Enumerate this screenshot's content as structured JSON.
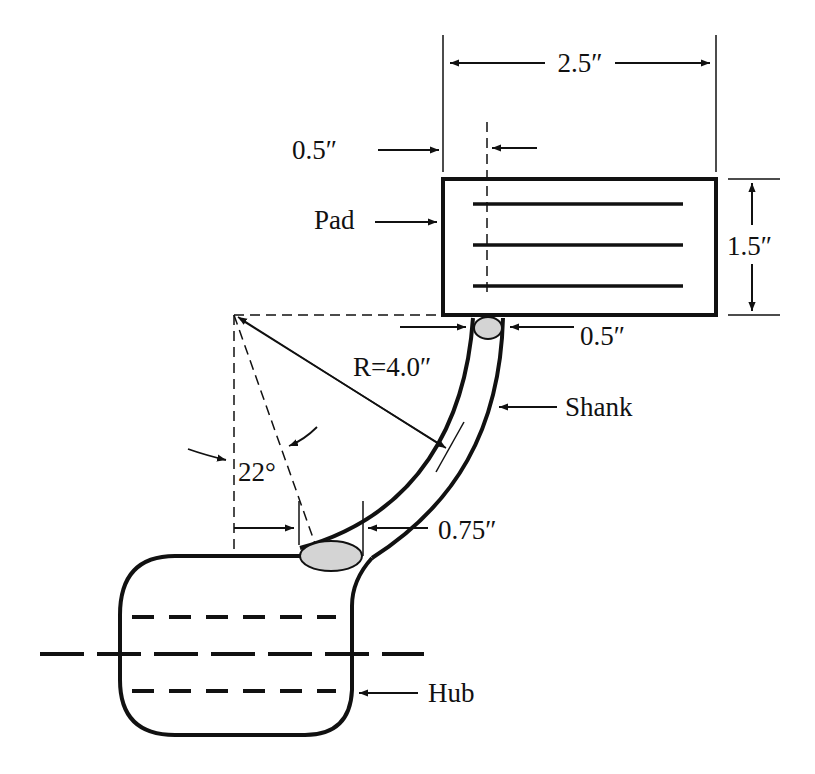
{
  "diagram": {
    "labels": {
      "pad_width": "2.5″",
      "pad_offset": "0.5″",
      "pad": "Pad",
      "pad_height": "1.5″",
      "shank_top_width": "0.5″",
      "radius": "R=4.0″",
      "shank": "Shank",
      "angle": "22°",
      "shank_bottom_width": "0.75″",
      "hub": "Hub"
    },
    "colors": {
      "line": "#111111",
      "weld_fill": "#d4d4d4",
      "background": "#ffffff"
    }
  }
}
